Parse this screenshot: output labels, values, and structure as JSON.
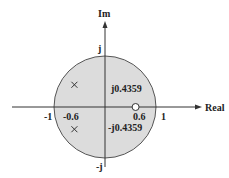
{
  "diagram": {
    "axes": {
      "horizontal_label": "Real",
      "vertical_label": "Im"
    },
    "unit_circle": {
      "radius": 1,
      "fill_color": "#dcdcdc",
      "stroke_color": "#555555"
    },
    "tick_labels": {
      "real_neg_one": "-1",
      "real_pos_one": "1",
      "imag_pos_one": "j",
      "imag_neg_one": "-j"
    },
    "poles": [
      {
        "re": -0.6,
        "im": 0.4359,
        "marker": "x"
      },
      {
        "re": -0.6,
        "im": -0.4359,
        "marker": "x"
      }
    ],
    "zeros": [
      {
        "re": 0.6,
        "im": 0,
        "marker": "o"
      }
    ],
    "annotations": {
      "pole_real_part": "-0.6",
      "zero_value": "0.6",
      "pole_imag_pos": "j0.4359",
      "pole_imag_neg": "-j0.4359"
    }
  }
}
